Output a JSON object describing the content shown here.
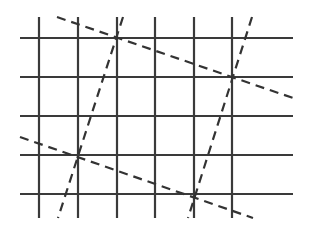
{
  "diagram": {
    "type": "grid-with-dashed-lines",
    "colors": {
      "grid": "#3a3a3a",
      "dashed": "#333333",
      "background": "#ffffff"
    },
    "grid": {
      "vertical_x": [
        39,
        78,
        117,
        155,
        194,
        232
      ],
      "vertical_y_range": [
        17,
        218
      ],
      "horizontal_y": [
        38,
        77,
        116,
        155,
        194
      ],
      "horizontal_x_range": [
        20,
        293
      ]
    },
    "dashed_lines": [
      {
        "name": "upper-descending",
        "x1": 57,
        "y1": 17,
        "x2": 293,
        "y2": 98
      },
      {
        "name": "right-steep",
        "x1": 252,
        "y1": 17,
        "x2": 188,
        "y2": 218
      },
      {
        "name": "left-steep",
        "x1": 123,
        "y1": 17,
        "x2": 58,
        "y2": 218
      },
      {
        "name": "lower-descending",
        "x1": 20,
        "y1": 137,
        "x2": 253,
        "y2": 218
      }
    ]
  }
}
